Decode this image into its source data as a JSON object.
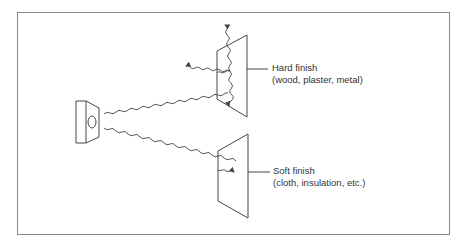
{
  "diagram": {
    "colors": {
      "line": "#444444",
      "frame": "#8a8a8a",
      "text": "#333333",
      "background": "#ffffff"
    },
    "source": {
      "icon": "loudspeaker-icon"
    },
    "surfaces": [
      {
        "id": "hard",
        "title": "Hard finish",
        "subtitle": "(wood, plaster, metal)",
        "behavior": "reflects sound in multiple directions"
      },
      {
        "id": "soft",
        "title": "Soft finish",
        "subtitle": "(cloth, insulation, etc.)",
        "behavior": "absorbs sound"
      }
    ]
  }
}
